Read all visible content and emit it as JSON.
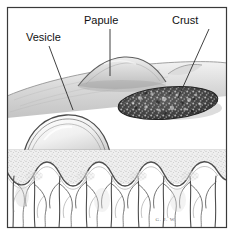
{
  "figure": {
    "background_color": "#ffffff",
    "border_color": "#3a3a3a",
    "ink_color": "#111111",
    "signature": "G. J. W."
  },
  "labels": [
    {
      "id": "vesicle",
      "text": "Vesicle",
      "x": 26,
      "y": 41,
      "anchor": "start",
      "leader": {
        "x1": 49,
        "y1": 46,
        "x2": 73,
        "y2": 110
      }
    },
    {
      "id": "papule",
      "text": "Papule",
      "x": 84,
      "y": 24,
      "anchor": "start",
      "leader": {
        "x1": 110,
        "y1": 29,
        "x2": 110,
        "y2": 76
      }
    },
    {
      "id": "crust",
      "text": "Crust",
      "x": 172,
      "y": 24,
      "anchor": "start",
      "leader": {
        "x1": 209,
        "y1": 29,
        "x2": 178,
        "y2": 98
      }
    }
  ],
  "lesions": [
    {
      "id": "vesicle",
      "kind": "fluid-filled blister",
      "label": "Vesicle"
    },
    {
      "id": "papule",
      "kind": "solid raised mound",
      "label": "Papule"
    },
    {
      "id": "crust",
      "kind": "dried exudate scab",
      "label": "Crust"
    }
  ],
  "layers": [
    {
      "id": "epidermis",
      "label": "Epidermis"
    },
    {
      "id": "dermis",
      "label": "Dermis"
    },
    {
      "id": "subcutis",
      "label": "Subcutaneous fat"
    }
  ]
}
